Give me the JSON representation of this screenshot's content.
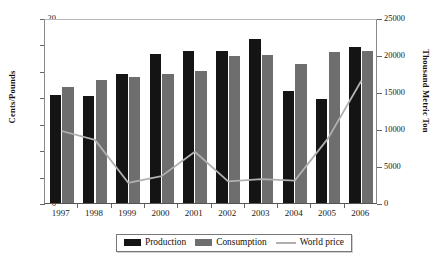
{
  "chart_data": {
    "type": "bar",
    "title": "",
    "subtitle": "",
    "categories": [
      "1997",
      "1998",
      "1999",
      "2000",
      "2001",
      "2002",
      "2003",
      "2004",
      "2005",
      "2006"
    ],
    "xlabel": "",
    "ylabel": "Cents/Pounds",
    "ylabel_secondary": "Thousand Metric Ton",
    "ylim": [
      6,
      20
    ],
    "yticks": [
      6,
      8,
      10,
      12,
      14,
      16,
      18,
      20
    ],
    "ylim_secondary": [
      0,
      25000
    ],
    "yticks_secondary": [
      0,
      5000,
      10000,
      15000,
      20000,
      25000
    ],
    "grid": false,
    "legend_position": "bottom",
    "series": [
      {
        "name": "Production",
        "kind": "bar",
        "axis": "left",
        "color": "#141414",
        "values": [
          14.2,
          14.1,
          15.8,
          17.3,
          17.5,
          17.5,
          18.4,
          14.5,
          13.9,
          17.8
        ]
      },
      {
        "name": "Consumption",
        "kind": "bar",
        "axis": "left",
        "color": "#6e6e6e",
        "values": [
          14.8,
          15.3,
          15.5,
          15.8,
          16.0,
          17.1,
          17.2,
          16.5,
          17.4,
          17.5
        ]
      },
      {
        "name": "World price",
        "kind": "line",
        "axis": "right",
        "color": "#b0b0b0",
        "values": [
          10000,
          8800,
          3000,
          3900,
          7200,
          3200,
          3500,
          3300,
          9000,
          16800
        ]
      }
    ]
  },
  "axes": {
    "left_title": "Cents/Pounds",
    "right_title": "Thousand Metric Ton",
    "left_ticks": [
      "6",
      "8",
      "10",
      "12",
      "14",
      "16",
      "18",
      "20"
    ],
    "right_ticks": [
      "0",
      "5000",
      "10000",
      "15000",
      "20000",
      "25000"
    ],
    "x_ticks": [
      "1997",
      "1998",
      "1999",
      "2000",
      "2001",
      "2002",
      "2003",
      "2004",
      "2005",
      "2006"
    ]
  },
  "legend": {
    "items": [
      {
        "label": "Production",
        "swatch": "bar-black"
      },
      {
        "label": "Consumption",
        "swatch": "bar-gray"
      },
      {
        "label": "World price",
        "swatch": "line-gray"
      }
    ]
  }
}
